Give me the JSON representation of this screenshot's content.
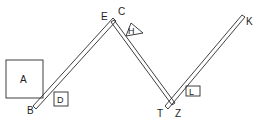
{
  "diagram": {
    "type": "mechanics-figure",
    "stroke_color": "#2a2a2a",
    "background": "#ffffff",
    "labels": {
      "A": "A",
      "B": "B",
      "C": "C",
      "D": "D",
      "E": "E",
      "H": "H",
      "K": "K",
      "L": "L",
      "T": "T",
      "Z": "Z"
    },
    "elements": {
      "box_A": {
        "label": "A",
        "shape": "square"
      },
      "box_D": {
        "label": "D",
        "shape": "small-square"
      },
      "triangle_H": {
        "label": "H",
        "shape": "triangle"
      },
      "box_L": {
        "label": "L",
        "shape": "small-rectangle"
      },
      "plank_BE": {
        "from": "B",
        "to": "E"
      },
      "plank_CT": {
        "from": "C",
        "to": "T"
      },
      "plank_ZK": {
        "from": "Z",
        "to": "K"
      }
    }
  }
}
